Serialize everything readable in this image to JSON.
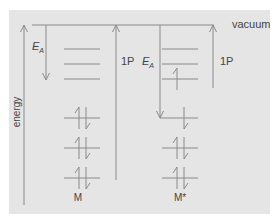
{
  "diagram": {
    "type": "energy-level-diagram",
    "labels": {
      "vacuum": "vacuum",
      "energy_axis": "energy",
      "ea_left": "E",
      "ea_left_sub": "A",
      "ip_middle": "1P",
      "ea_middle": "E",
      "ea_middle_sub": "A",
      "ip_right": "1P",
      "species_ground": "M",
      "species_excited": "M*"
    },
    "species": [
      {
        "name": "M",
        "empty_levels": 3,
        "filled_levels": 3,
        "electrons_per_filled_level": 2
      },
      {
        "name": "M*",
        "empty_levels": 3,
        "empty_levels_with_electron": 1,
        "filled_levels": 3,
        "electrons_per_filled_level": 2,
        "highest_filled_level_electrons": 1
      }
    ],
    "arrows": [
      {
        "name": "energy-axis",
        "direction": "up"
      },
      {
        "name": "electron-affinity-M",
        "label": "E_A",
        "direction": "down"
      },
      {
        "name": "ionization-potential-M",
        "label": "1P",
        "direction": "up"
      },
      {
        "name": "electron-affinity-M-star",
        "label": "E_A",
        "direction": "down"
      },
      {
        "name": "ionization-potential-M-star",
        "label": "1P",
        "direction": "up"
      }
    ],
    "colors": {
      "background": "#e5e5e5",
      "line": "#8a8a8a",
      "text": "#444444"
    }
  }
}
